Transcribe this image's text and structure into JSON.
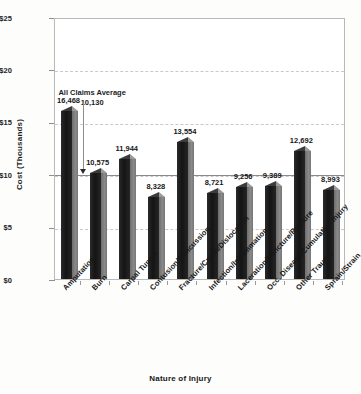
{
  "header": {
    "ghost_text": ""
  },
  "axes": {
    "y_title": "Cost (Thousands)",
    "x_title": "Nature of Injury",
    "y_ticks": [
      "$0",
      "$5",
      "$10",
      "$15",
      "$20",
      "$25"
    ]
  },
  "annotation": {
    "label": "All Claims Average",
    "value": "10,130"
  },
  "chart_data": {
    "type": "bar",
    "title": "",
    "xlabel": "Nature of Injury",
    "ylabel": "Cost (Thousands)",
    "ylim": [
      0,
      25000
    ],
    "ytick_values": [
      0,
      5000,
      10000,
      15000,
      20000,
      25000
    ],
    "ytick_labels": [
      "$0",
      "$5",
      "$10",
      "$15",
      "$20",
      "$25"
    ],
    "grid": true,
    "legend": "none",
    "units": "dollars",
    "categories": [
      "Amputation",
      "Burn",
      "Carpal Tunnel",
      "Contusion/Concussion",
      "Fracture/Crush/Dislocation",
      "Infection/Inflammation",
      "Laceration/Puncture/Rupture",
      "Occ. Disease/Cumulative Injury",
      "Other Trauma",
      "Sprain/Strain"
    ],
    "values": [
      16468,
      10575,
      11944,
      8328,
      13554,
      8721,
      9256,
      9389,
      12692,
      8993
    ],
    "value_labels": [
      "16,468",
      "10,575",
      "11,944",
      "8,328",
      "13,554",
      "8,721",
      "9,256",
      "9,389",
      "12,692",
      "8,993"
    ],
    "reference_line": {
      "label": "All Claims Average",
      "value": 10130,
      "value_label": "10,130"
    }
  },
  "colors": {
    "bar_front": "#141414",
    "bar_side": "#8a8a8a",
    "gridline": "#c9c9c9",
    "frame": "#b9b9b9",
    "text": "#171717",
    "background": "#fdfdfc"
  }
}
